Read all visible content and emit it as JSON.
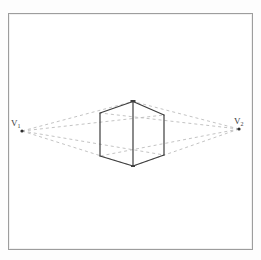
{
  "figure": {
    "type": "two-point-perspective-construction",
    "background_color": "#fdfdfd",
    "border": {
      "name": "drawing-frame",
      "color": "#9a9a9a",
      "x": 8,
      "y": 13,
      "width": 245,
      "height": 237
    },
    "vanishing_points": [
      {
        "id": "v1",
        "label": "V",
        "subscript": "1",
        "x": 21,
        "y": 130,
        "side": "left"
      },
      {
        "id": "v2",
        "label": "V",
        "subscript": "2",
        "x": 240,
        "y": 128,
        "side": "right"
      }
    ],
    "cube": {
      "name": "perspective-cube",
      "stroke_color": "#3d3d3d",
      "stroke_width": 1.1,
      "vertices": {
        "front_top": {
          "x": 133,
          "y": 101
        },
        "front_bottom": {
          "x": 133,
          "y": 166
        },
        "left_top": {
          "x": 100,
          "y": 113
        },
        "left_bottom": {
          "x": 100,
          "y": 156
        },
        "right_top": {
          "x": 164,
          "y": 115
        },
        "right_bottom": {
          "x": 164,
          "y": 155
        }
      },
      "edges": [
        "front_top-front_bottom",
        "front_top-left_top",
        "front_top-right_top",
        "left_top-left_bottom",
        "right_top-right_bottom",
        "left_bottom-front_bottom",
        "front_bottom-right_bottom"
      ]
    },
    "construction_lines": {
      "name": "vanishing-construction-lines",
      "color": "#b9b9b9",
      "dash": "3 3",
      "stroke_width": 0.9,
      "lines": [
        {
          "from": "v1",
          "to_x": 133,
          "to_y": 101
        },
        {
          "from": "v1",
          "to_x": 164,
          "to_y": 115
        },
        {
          "from": "v1",
          "to_x": 133,
          "to_y": 166
        },
        {
          "from": "v1",
          "to_x": 164,
          "to_y": 155
        },
        {
          "from": "v2",
          "to_x": 133,
          "to_y": 101
        },
        {
          "from": "v2",
          "to_x": 100,
          "to_y": 113
        },
        {
          "from": "v2",
          "to_x": 133,
          "to_y": 166
        },
        {
          "from": "v2",
          "to_x": 100,
          "to_y": 156
        }
      ]
    }
  }
}
